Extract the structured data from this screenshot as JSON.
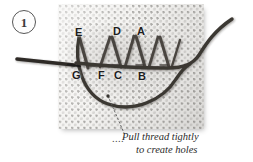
{
  "figure": {
    "step_number": "1",
    "fabric_color": "#f4f3f1",
    "thread_color": "#403c38",
    "needle_color": "#2e2b28",
    "label_color": "#1d1d1d",
    "stitch_point_labels": {
      "top_row": [
        {
          "id": "E",
          "label": "E",
          "x": 78,
          "y": 32
        },
        {
          "id": "D",
          "label": "D",
          "x": 117,
          "y": 31
        },
        {
          "id": "A",
          "label": "A",
          "x": 140,
          "y": 31
        }
      ],
      "bottom_row": [
        {
          "id": "G",
          "label": "G",
          "x": 76,
          "y": 70
        },
        {
          "id": "F",
          "label": "F",
          "x": 100,
          "y": 70
        },
        {
          "id": "C",
          "label": "C",
          "x": 117,
          "y": 70
        },
        {
          "id": "B",
          "label": "B",
          "x": 140,
          "y": 70
        }
      ]
    },
    "caption": {
      "leader_dots": "....",
      "line1": "Pull thread tightly",
      "line2": "to create holes"
    }
  }
}
